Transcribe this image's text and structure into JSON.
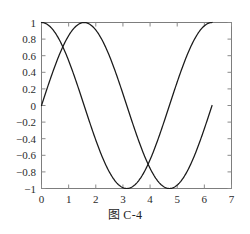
{
  "caption": "图 C-4",
  "chart_data": {
    "type": "line",
    "title": "",
    "xlabel": "",
    "ylabel": "",
    "xlim": [
      0,
      7
    ],
    "ylim": [
      -1,
      1
    ],
    "grid": false,
    "legend": "none",
    "background": "#ffffff",
    "axis_color": "#7d7d7d",
    "xticks": [
      0,
      1,
      2,
      3,
      4,
      5,
      6,
      7
    ],
    "xtick_labels": [
      "0",
      "1",
      "2",
      "3",
      "4",
      "5",
      "6",
      "7"
    ],
    "yticks": [
      1,
      0.8,
      0.6,
      0.4,
      0.2,
      0,
      -0.2,
      -0.4,
      -0.6,
      -0.8,
      -1
    ],
    "ytick_labels": [
      "1",
      "0.8",
      "0.6",
      "0.4",
      "0.2",
      "0",
      "−0.2",
      "−0.4",
      "−0.6",
      "−0.8",
      "−1"
    ],
    "x_domain": [
      0,
      6.2832
    ],
    "series": [
      {
        "name": "cos(x)",
        "color": "#1a1a1a",
        "function": "cos",
        "start_point": [
          0,
          1
        ],
        "end_point": [
          6.2832,
          1
        ],
        "minimum": [
          3.1416,
          -1
        ],
        "x": [
          0,
          0.3927,
          0.7854,
          1.1781,
          1.5708,
          1.9635,
          2.3562,
          2.7489,
          3.1416,
          3.5343,
          3.927,
          4.3197,
          4.7124,
          5.1051,
          5.4978,
          5.8905,
          6.2832
        ],
        "values": [
          1,
          0.924,
          0.707,
          0.383,
          0,
          -0.383,
          -0.707,
          -0.924,
          -1,
          -0.924,
          -0.707,
          -0.383,
          0,
          0.383,
          0.707,
          0.924,
          1
        ]
      },
      {
        "name": "sin(x)",
        "color": "#1a1a1a",
        "function": "sin",
        "start_point": [
          0,
          0
        ],
        "end_point": [
          6.2832,
          0
        ],
        "maximum": [
          1.5708,
          1
        ],
        "minimum": [
          4.7124,
          -1
        ],
        "x": [
          0,
          0.3927,
          0.7854,
          1.1781,
          1.5708,
          1.9635,
          2.3562,
          2.7489,
          3.1416,
          3.5343,
          3.927,
          4.3197,
          4.7124,
          5.1051,
          5.4978,
          5.8905,
          6.2832
        ],
        "values": [
          0,
          0.383,
          0.707,
          0.924,
          1,
          0.924,
          0.707,
          0.383,
          0,
          -0.383,
          -0.707,
          -0.924,
          -1,
          -0.924,
          -0.707,
          -0.383,
          0
        ]
      }
    ],
    "intersections": [
      [
        0.7854,
        0.707
      ],
      [
        3.927,
        -0.707
      ]
    ]
  }
}
